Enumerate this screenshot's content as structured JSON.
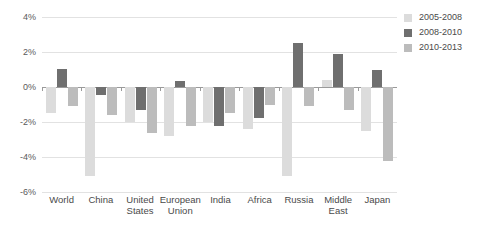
{
  "chart_data": {
    "type": "bar",
    "title": "",
    "subtitle": "",
    "xlabel": "",
    "ylabel": "",
    "ylim": [
      -6,
      4
    ],
    "ytick_labels": [
      "4%",
      "2%",
      "0%",
      "-2%",
      "-4%",
      "-6%"
    ],
    "ytick_values": [
      4,
      2,
      0,
      -2,
      -4,
      -6
    ],
    "grid": true,
    "legend_position": "right",
    "categories": [
      "World",
      "China",
      "United States",
      "European Union",
      "India",
      "Africa",
      "Russia",
      "Middle East",
      "Japan"
    ],
    "series": [
      {
        "name": "2005-2008",
        "color": "#dcdcdc",
        "values": [
          -1.5,
          -5.1,
          -2.0,
          -2.8,
          -2.0,
          -2.4,
          -5.1,
          0.4,
          -2.5
        ]
      },
      {
        "name": "2008-2010",
        "color": "#6f6f6f",
        "values": [
          1.05,
          -0.45,
          -1.3,
          0.35,
          -2.2,
          -1.75,
          2.5,
          1.9,
          0.95
        ]
      },
      {
        "name": "2010-2013",
        "color": "#bcbcbc",
        "values": [
          -1.1,
          -1.6,
          -2.6,
          -2.25,
          -1.5,
          -1.05,
          -1.1,
          -1.3,
          -4.2
        ]
      }
    ]
  },
  "legend": {
    "items": [
      {
        "label": "2005-2008",
        "color": "#dcdcdc"
      },
      {
        "label": "2008-2010",
        "color": "#6f6f6f"
      },
      {
        "label": "2010-2013",
        "color": "#bcbcbc"
      }
    ]
  },
  "axis": {
    "zero_line_color": "#9a9a9a",
    "gridline_color": "#e2e2e2"
  }
}
